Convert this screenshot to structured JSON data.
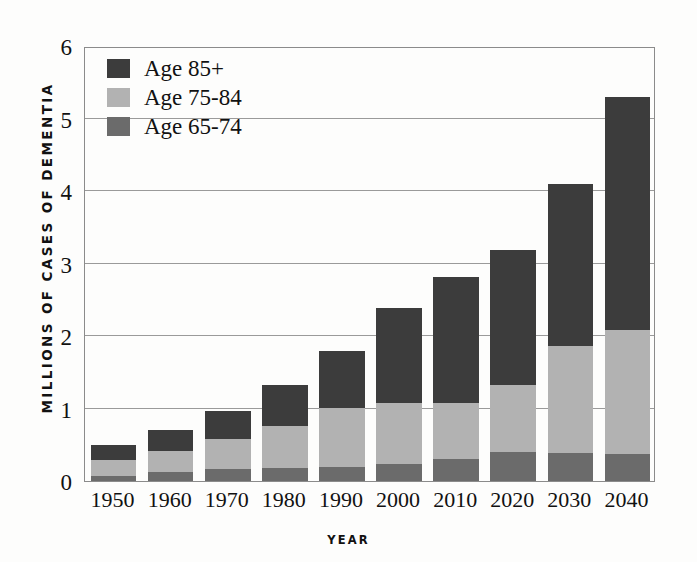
{
  "chart_data": {
    "type": "bar",
    "title": "",
    "subtitle": "",
    "xlabel": "YEAR",
    "ylabel": "MILLIONS OF CASES OF DEMENTIA",
    "stacked": true,
    "grid": true,
    "legend_position": "top-left",
    "ylim": [
      0,
      6
    ],
    "yticks": [
      0,
      1,
      2,
      3,
      4,
      5,
      6
    ],
    "ytick_labels": [
      "0",
      "1",
      "2",
      "3",
      "4",
      "5",
      "6"
    ],
    "categories": [
      "1950",
      "1960",
      "1970",
      "1980",
      "1990",
      "2000",
      "2010",
      "2020",
      "2030",
      "2040"
    ],
    "series": [
      {
        "name": "Age 65-74",
        "color": "#6b6b6b",
        "values": [
          0.07,
          0.12,
          0.16,
          0.18,
          0.2,
          0.24,
          0.3,
          0.4,
          0.38,
          0.37
        ]
      },
      {
        "name": "Age 75-84",
        "color": "#b2b2b2",
        "values": [
          0.22,
          0.29,
          0.42,
          0.58,
          0.81,
          0.83,
          0.78,
          0.92,
          1.48,
          1.71
        ]
      },
      {
        "name": "Age 85+",
        "color": "#3c3c3c",
        "values": [
          0.21,
          0.29,
          0.38,
          0.56,
          0.79,
          1.31,
          1.74,
          1.87,
          2.23,
          3.22
        ]
      }
    ],
    "totals": [
      0.5,
      0.7,
      0.96,
      1.32,
      1.8,
      2.38,
      2.82,
      3.19,
      4.09,
      5.3
    ]
  },
  "legend": {
    "entries": [
      {
        "label": "Age 85+",
        "color": "#3c3c3c"
      },
      {
        "label": "Age 75-84",
        "color": "#b2b2b2"
      },
      {
        "label": "Age 65-74",
        "color": "#6b6b6b"
      }
    ]
  },
  "axes": {
    "y_title": "MILLIONS OF CASES OF DEMENTIA",
    "x_title": "YEAR"
  }
}
